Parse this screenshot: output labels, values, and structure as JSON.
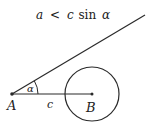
{
  "title": {
    "lhs": "a",
    "op": "<",
    "rhs_var": "c",
    "func": "sin",
    "angle": "α"
  },
  "labels": {
    "point_a": "A",
    "point_b": "B",
    "side_c": "c",
    "angle_alpha": "α"
  },
  "geometry": {
    "point_a": [
      12,
      94
    ],
    "point_b": [
      92,
      94
    ],
    "ray_end": [
      145,
      15
    ],
    "circle_center": [
      92,
      94
    ],
    "circle_radius": 27
  },
  "colors": {
    "stroke": "#2a2a2a",
    "background": "#ffffff"
  }
}
